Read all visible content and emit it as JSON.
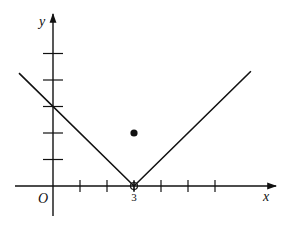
{
  "chart_data": {
    "type": "line",
    "title": "",
    "function": "y = |x - 3|",
    "xlabel": "x",
    "ylabel": "y",
    "origin_label": "O",
    "xlim": [
      -1.4,
      8.2
    ],
    "ylim": [
      -1.1,
      6.4
    ],
    "grid": false,
    "x_ticks": [
      1,
      2,
      3,
      4,
      5,
      6
    ],
    "y_ticks": [
      1,
      2,
      3,
      4,
      5
    ],
    "tick_labels": [
      {
        "axis": "x",
        "value": 3,
        "text": "3"
      }
    ],
    "series": [
      {
        "name": "graph",
        "points": [
          [
            -1.26,
            4.26
          ],
          [
            3,
            0
          ],
          [
            7.33,
            4.33
          ]
        ]
      }
    ],
    "points": [
      {
        "name": "filled-point",
        "x": 3,
        "y": 2,
        "style": "filled"
      },
      {
        "name": "vertex-marker",
        "x": 3,
        "y": 0,
        "style": "open-crosshair"
      }
    ]
  }
}
